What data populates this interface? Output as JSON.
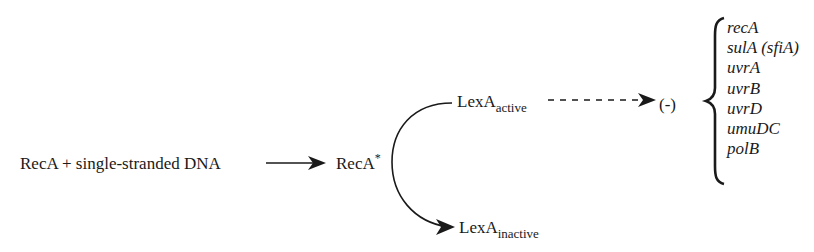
{
  "diagram": {
    "reactants": "RecA + single-stranded DNA",
    "activated": {
      "base": "RecA",
      "superscript": "*"
    },
    "lexa_active": {
      "base": "LexA",
      "subscript": "active"
    },
    "lexa_inactive": {
      "base": "LexA",
      "subscript": "inactive"
    },
    "repression_symbol": "(-)",
    "repressed_genes": [
      "recA",
      "sulA (sfiA)",
      "uvrA",
      "uvrB",
      "uvrD",
      "umuDC",
      "polB"
    ],
    "colors": {
      "ink": "#1a1a1a",
      "background": "#ffffff"
    }
  }
}
